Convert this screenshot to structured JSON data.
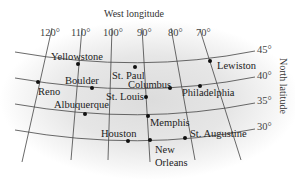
{
  "map": {
    "top_label": "West longitude",
    "side_label": "North latitude",
    "longitudes": [
      {
        "label": "120°",
        "x": 40,
        "y": 36
      },
      {
        "label": "110°",
        "x": 71,
        "y": 36
      },
      {
        "label": "100°",
        "x": 103,
        "y": 36
      },
      {
        "label": "90°",
        "x": 137,
        "y": 36
      },
      {
        "label": "80°",
        "x": 168,
        "y": 36
      },
      {
        "label": "70°",
        "x": 196,
        "y": 36
      }
    ],
    "latitudes": [
      {
        "label": "45°",
        "x": 257,
        "y": 53
      },
      {
        "label": "40°",
        "x": 257,
        "y": 79
      },
      {
        "label": "35°",
        "x": 257,
        "y": 104
      },
      {
        "label": "30°",
        "x": 257,
        "y": 130
      }
    ],
    "cities": [
      {
        "name": "Yellowstone",
        "dot": [
          78,
          64
        ],
        "label": [
          51,
          60
        ]
      },
      {
        "name": "St. Paul",
        "dot": [
          135,
          67
        ],
        "label": [
          112,
          79
        ]
      },
      {
        "name": "Lewiston",
        "dot": [
          210,
          61
        ],
        "label": [
          217,
          69
        ]
      },
      {
        "name": "Reno",
        "dot": [
          38,
          82
        ],
        "label": [
          38,
          95
        ]
      },
      {
        "name": "Boulder",
        "dot": [
          92,
          88
        ],
        "label": [
          65,
          84
        ]
      },
      {
        "name": "Columbus",
        "dot": [
          170,
          88
        ],
        "label": [
          128,
          88
        ]
      },
      {
        "name": "Philadelphia",
        "dot": [
          200,
          86
        ],
        "label": [
          182,
          96
        ]
      },
      {
        "name": "St. Louis",
        "dot": [
          146,
          97
        ],
        "label": [
          106,
          100
        ]
      },
      {
        "name": "Albuquerque",
        "dot": [
          85,
          114
        ],
        "label": [
          54,
          108
        ]
      },
      {
        "name": "Memphis",
        "dot": [
          148,
          116
        ],
        "label": [
          150,
          126
        ]
      },
      {
        "name": "Houston",
        "dot": [
          128,
          141
        ],
        "label": [
          101,
          137
        ]
      },
      {
        "name": "New Orleans",
        "dot": [
          150,
          140
        ],
        "label": [
          155,
          153
        ],
        "label2": [
          155,
          166
        ],
        "line1": "New",
        "line2": "Orleans"
      },
      {
        "name": "St. Augustine",
        "dot": [
          185,
          138
        ],
        "label": [
          190,
          137
        ]
      }
    ]
  }
}
